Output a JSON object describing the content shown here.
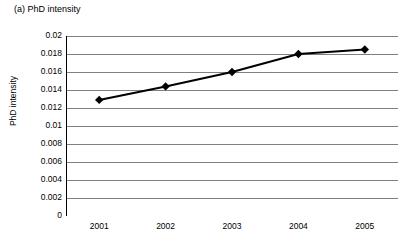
{
  "chart_data": {
    "type": "line",
    "title": "(a) PhD intensity",
    "xlabel": "",
    "ylabel": "PhD intensity",
    "categories": [
      "2001",
      "2002",
      "2003",
      "2004",
      "2005"
    ],
    "values": [
      0.0129,
      0.0144,
      0.016,
      0.018,
      0.0185
    ],
    "series": [
      {
        "name": "PhD intensity",
        "values": [
          0.0129,
          0.0144,
          0.016,
          0.018,
          0.0185
        ]
      }
    ],
    "ylim": [
      0,
      0.02
    ],
    "yticks": [
      0,
      0.002,
      0.004,
      0.006,
      0.008,
      0.01,
      0.012,
      0.014,
      0.016,
      0.018,
      0.02
    ],
    "ytick_labels": [
      "0",
      "0.002",
      "0.004",
      "0.006",
      "0.008",
      "0.01",
      "0.012",
      "0.014",
      "0.016",
      "0.018",
      "0.02"
    ],
    "grid": true,
    "grid_axis": "y",
    "legend": false,
    "legend_position": "none",
    "marker": "diamond",
    "line_color": "#000000",
    "marker_color": "#000000",
    "grid_color": "#808080",
    "axis_color": "#000000",
    "plot_background": "#ffffff"
  }
}
